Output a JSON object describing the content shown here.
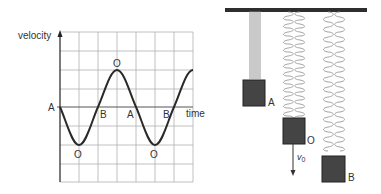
{
  "graph": {
    "y_axis_label": "velocity",
    "x_axis_label": "time",
    "zero_label": "A",
    "point_labels": [
      {
        "text": "O",
        "x": 79,
        "y": 158
      },
      {
        "text": "B",
        "x": 100,
        "y": 118
      },
      {
        "text": "O",
        "x": 117,
        "y": 66
      },
      {
        "text": "A",
        "x": 130,
        "y": 118
      },
      {
        "text": "B",
        "x": 166,
        "y": 118
      },
      {
        "text": "O",
        "x": 153,
        "y": 158
      }
    ],
    "curve_color": "#2a2a2a",
    "grid_color": "#aaaaaa"
  },
  "springs": {
    "bar_color": "#2e2e2e",
    "block_color": "#444444",
    "labels": {
      "A": "A",
      "O": "O",
      "B": "B",
      "velocity": "v",
      "velocity_sub": "0"
    }
  }
}
